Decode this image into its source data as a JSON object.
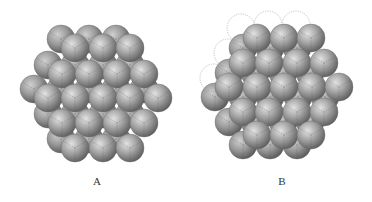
{
  "figure": {
    "sphere_radius": 14,
    "colors": {
      "sphere_light": "#d6d6d6",
      "sphere_mid": "#9a9a9a",
      "sphere_dark": "#5e5e5e",
      "seam": "#4a4a4a",
      "empty_site": "#9a9a9a",
      "label": "#333333"
    },
    "panels": [
      {
        "id": "A",
        "label": "A",
        "label_pos": [
          97,
          185
        ],
        "back_offset": [
          -14,
          -9
        ],
        "front_rows": [
          {
            "y": 48,
            "x": [
              75,
              103,
              130
            ]
          },
          {
            "y": 74,
            "x": [
              62,
              89,
              117,
              144
            ]
          },
          {
            "y": 98,
            "x": [
              48,
              75,
              103,
              130,
              158
            ]
          },
          {
            "y": 123,
            "x": [
              62,
              89,
              117,
              144
            ]
          },
          {
            "y": 148,
            "x": [
              75,
              103,
              130
            ]
          }
        ],
        "empty_sites": []
      },
      {
        "id": "B",
        "label": "B",
        "label_pos": [
          282,
          185
        ],
        "back_offset": [
          -14,
          10
        ],
        "front_rows": [
          {
            "y": 38,
            "x": [
              257,
              284,
              311
            ]
          },
          {
            "y": 63,
            "x": [
              243,
              269,
              297,
              324
            ]
          },
          {
            "y": 87,
            "x": [
              229,
              257,
              284,
              312,
              339
            ]
          },
          {
            "y": 112,
            "x": [
              243,
              269,
              297,
              324
            ]
          },
          {
            "y": 135,
            "x": [
              257,
              284,
              311
            ]
          }
        ],
        "empty_sites": [
          [
            241,
            28
          ],
          [
            268,
            25
          ],
          [
            296,
            25
          ],
          [
            228,
            53
          ],
          [
            214,
            78
          ]
        ]
      }
    ]
  }
}
